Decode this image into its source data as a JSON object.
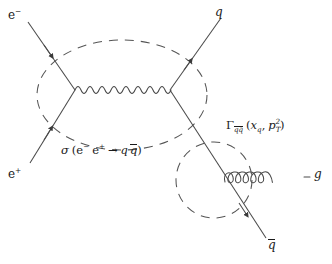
{
  "figure": {
    "kind": "feynman-diagram",
    "background_color": "#ffffff",
    "line_color": "#4a4a4a",
    "text_color": "#1a1a1a",
    "width": 332,
    "height": 264
  },
  "labels": {
    "electron_in": {
      "base": "e",
      "charge": "−"
    },
    "positron_in": {
      "base": "e",
      "charge": "+"
    },
    "quark_out": "q",
    "antiquark_out": "q",
    "gluon_out": "g",
    "cross_section": {
      "symbol": "σ",
      "open_paren": "(",
      "initial_1": "e",
      "initial_1_charge": "−",
      "initial_2": "e",
      "initial_2_charge": "+",
      "arrow": "→",
      "final_1": "q",
      "final_2": "q",
      "close_paren": ")",
      "full_text": "σ (e⁻ e⁺ → q q̄)"
    },
    "fragmentation_function": {
      "symbol": "Γ",
      "subscript": "qq̄",
      "open_paren": "(",
      "arg_1_base": "x",
      "arg_1_sub": "q",
      "comma": ",",
      "arg_2_base": "p",
      "arg_2_sub": "T",
      "arg_2_sup": "2",
      "close_paren": ")",
      "full_text": "Γ_{q q̄} (x_q , p_T²)"
    }
  },
  "propagators": {
    "photon": {
      "style": "wavy",
      "waves": 8,
      "orientation": "horizontal"
    },
    "gluon": {
      "style": "coil",
      "loops": 5,
      "orientation": "horizontal"
    }
  },
  "blobs": [
    {
      "name": "hard-scattering-blob",
      "shape": "ellipse",
      "style": "dashed",
      "cx": 122,
      "cy": 95,
      "rx": 85,
      "ry": 55
    },
    {
      "name": "fragmentation-blob",
      "shape": "circle",
      "style": "dashed",
      "cx": 214,
      "cy": 180,
      "r": 38
    }
  ],
  "vertices": [
    {
      "name": "electron-blob-entry",
      "x": 51,
      "y": 57
    },
    {
      "name": "positron-blob-entry",
      "x": 51,
      "y": 128
    },
    {
      "name": "annihilation-vertex-left",
      "x": 75,
      "y": 90
    },
    {
      "name": "annihilation-vertex-right",
      "x": 170,
      "y": 90
    },
    {
      "name": "quark-blob-exit",
      "x": 190,
      "y": 60
    },
    {
      "name": "gluon-emission-vertex",
      "x": 212,
      "y": 158
    },
    {
      "name": "antiquark-blob-exit",
      "x": 248,
      "y": 216
    }
  ]
}
